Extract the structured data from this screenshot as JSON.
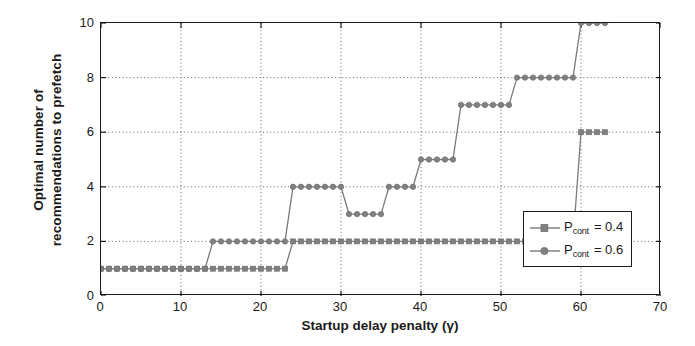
{
  "chart_data": {
    "type": "line",
    "title": "",
    "xlabel": "Startup delay penalty (γ)",
    "ylabel_line1": "Optimal number of",
    "ylabel_line2": "recommendations to prefetch",
    "xlim": [
      0,
      70
    ],
    "ylim": [
      0,
      10
    ],
    "xticks": [
      0,
      10,
      20,
      30,
      40,
      50,
      60,
      70
    ],
    "yticks": [
      0,
      2,
      4,
      6,
      8,
      10
    ],
    "grid": true,
    "grid_style": "dotted",
    "legend_position": "lower right",
    "line_color": "#7a7a7a",
    "marker_color": "#808080",
    "axis_color": "#1a1a1a",
    "series": [
      {
        "name": "P_cont = 0.4",
        "label_base": "P",
        "label_sub": "cont",
        "label_value": "= 0.4",
        "marker": "square",
        "x": [
          0,
          1,
          2,
          3,
          4,
          5,
          6,
          7,
          8,
          9,
          10,
          11,
          12,
          13,
          14,
          15,
          16,
          17,
          18,
          19,
          20,
          21,
          22,
          23,
          24,
          25,
          26,
          27,
          28,
          29,
          30,
          31,
          32,
          33,
          34,
          35,
          36,
          37,
          38,
          39,
          40,
          41,
          42,
          43,
          44,
          45,
          46,
          47,
          48,
          49,
          50,
          51,
          52,
          53,
          54,
          55,
          56,
          57,
          58,
          59,
          60,
          61,
          62,
          63
        ],
        "y": [
          1,
          1,
          1,
          1,
          1,
          1,
          1,
          1,
          1,
          1,
          1,
          1,
          1,
          1,
          1,
          1,
          1,
          1,
          1,
          1,
          1,
          1,
          1,
          1,
          2,
          2,
          2,
          2,
          2,
          2,
          2,
          2,
          2,
          2,
          2,
          2,
          2,
          2,
          2,
          2,
          2,
          2,
          2,
          2,
          2,
          2,
          2,
          2,
          2,
          2,
          2,
          2,
          2,
          2,
          2,
          2,
          2,
          2,
          2,
          2,
          6,
          6,
          6,
          6
        ]
      },
      {
        "name": "P_cont = 0.6",
        "label_base": "P",
        "label_sub": "cont",
        "label_value": "= 0.6",
        "marker": "circle",
        "x": [
          0,
          1,
          2,
          3,
          4,
          5,
          6,
          7,
          8,
          9,
          10,
          11,
          12,
          13,
          14,
          15,
          16,
          17,
          18,
          19,
          20,
          21,
          22,
          23,
          24,
          25,
          26,
          27,
          28,
          29,
          30,
          31,
          32,
          33,
          34,
          35,
          36,
          37,
          38,
          39,
          40,
          41,
          42,
          43,
          44,
          45,
          46,
          47,
          48,
          49,
          50,
          51,
          52,
          53,
          54,
          55,
          56,
          57,
          58,
          59,
          60,
          61,
          62,
          63
        ],
        "y": [
          1,
          1,
          1,
          1,
          1,
          1,
          1,
          1,
          1,
          1,
          1,
          1,
          1,
          1,
          2,
          2,
          2,
          2,
          2,
          2,
          2,
          2,
          2,
          2,
          4,
          4,
          4,
          4,
          4,
          4,
          4,
          3,
          3,
          3,
          3,
          3,
          4,
          4,
          4,
          4,
          5,
          5,
          5,
          5,
          5,
          7,
          7,
          7,
          7,
          7,
          7,
          7,
          8,
          8,
          8,
          8,
          8,
          8,
          8,
          8,
          10,
          10,
          10,
          10
        ]
      }
    ]
  },
  "axis": {
    "xtick_labels": [
      "0",
      "10",
      "20",
      "30",
      "40",
      "50",
      "60",
      "70"
    ],
    "ytick_labels": [
      "0",
      "2",
      "4",
      "6",
      "8",
      "10"
    ]
  }
}
